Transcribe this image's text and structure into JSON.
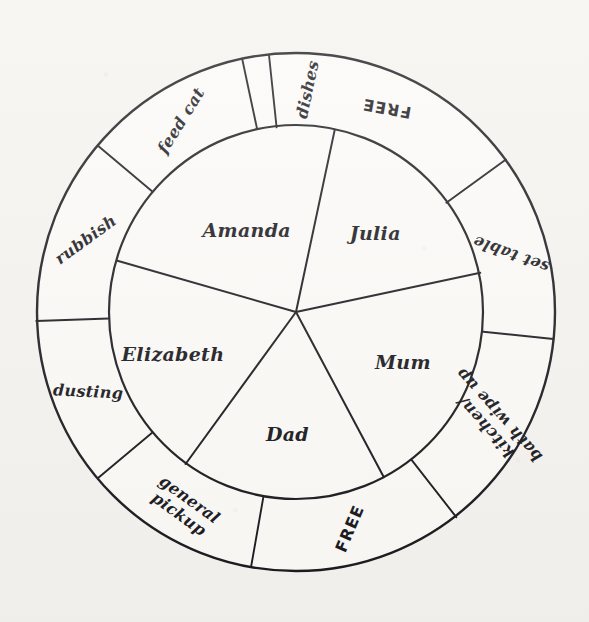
{
  "figure": {
    "kind": "chore-wheel-diagram",
    "medium": "hand-drawn ink on paper",
    "background_color": "#f5f3ef",
    "ink_color": "#17161a"
  },
  "geometry": {
    "center_x": 296,
    "center_y": 312,
    "outer_radius": 259,
    "inner_radius": 187
  },
  "inner_wheel": {
    "name": "family-members",
    "count": 5,
    "sectors": [
      {
        "label": "Julia",
        "start_deg": -78,
        "end_deg": -12,
        "label_radius": 112,
        "label_rotation": 0
      },
      {
        "label": "Mum",
        "start_deg": -12,
        "end_deg": 62,
        "label_radius": 118,
        "label_rotation": 0
      },
      {
        "label": "Dad",
        "start_deg": 62,
        "end_deg": 126,
        "label_radius": 122,
        "label_rotation": 0
      },
      {
        "label": "Elizabeth",
        "start_deg": 126,
        "end_deg": 196,
        "label_radius": 130,
        "label_rotation": 0
      },
      {
        "label": "Amanda",
        "start_deg": 196,
        "end_deg": 282,
        "label_radius": 96,
        "label_rotation": 0
      }
    ]
  },
  "outer_ring": {
    "name": "chores",
    "count": 9,
    "segments": [
      {
        "label": "FREE",
        "lines": [
          "FREE"
        ],
        "start_deg": -96,
        "end_deg": -36,
        "label_rotation": 190,
        "style": "free"
      },
      {
        "label": "set table",
        "lines": [
          "set table"
        ],
        "start_deg": -36,
        "end_deg": 6,
        "label_rotation": 200,
        "style": "script"
      },
      {
        "label": "kitchen/ bath wipe up",
        "lines": [
          "kitchen/",
          "bath wipe up"
        ],
        "start_deg": 6,
        "end_deg": 52,
        "label_rotation": 228,
        "style": "script"
      },
      {
        "label": "FREE",
        "lines": [
          "FREE"
        ],
        "start_deg": 52,
        "end_deg": 100,
        "label_rotation": 293,
        "style": "free"
      },
      {
        "label": "general pickup",
        "lines": [
          "general",
          "pickup"
        ],
        "start_deg": 100,
        "end_deg": 140,
        "label_rotation": 36,
        "style": "script"
      },
      {
        "label": "dusting",
        "lines": [
          "dusting"
        ],
        "start_deg": 140,
        "end_deg": 178,
        "label_rotation": 3,
        "style": "script"
      },
      {
        "label": "rubbish",
        "lines": [
          "rubbish"
        ],
        "start_deg": 178,
        "end_deg": 220,
        "label_rotation": -36,
        "style": "script"
      },
      {
        "label": "feed cat",
        "lines": [
          "feed cat"
        ],
        "start_deg": 220,
        "end_deg": 258,
        "label_rotation": -58,
        "style": "script"
      },
      {
        "label": "dishes",
        "lines": [
          "dishes"
        ],
        "start_deg": 258,
        "end_deg": 288,
        "label_rotation": -78,
        "style": "script"
      }
    ]
  },
  "chart_data": {
    "type": "pie",
    "rings": [
      {
        "name": "inner",
        "categories": [
          "Julia",
          "Mum",
          "Dad",
          "Elizabeth",
          "Amanda"
        ],
        "values": [
          66,
          74,
          64,
          70,
          86
        ]
      },
      {
        "name": "outer",
        "categories": [
          "FREE",
          "set table",
          "kitchen/ bath wipe up",
          "FREE",
          "general pickup",
          "dusting",
          "rubbish",
          "feed cat",
          "dishes"
        ],
        "values": [
          60,
          42,
          46,
          48,
          40,
          38,
          42,
          38,
          30
        ]
      }
    ],
    "xlabel": "",
    "ylabel": "",
    "legend": "none",
    "grid": false
  }
}
